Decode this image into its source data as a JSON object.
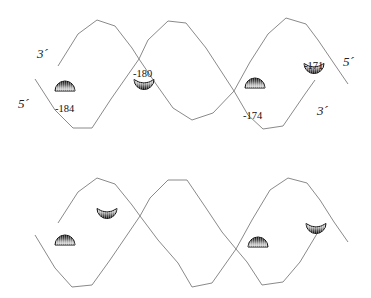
{
  "figure": {
    "panels": [
      {
        "id": "top",
        "strand_ends": [
          {
            "text": "3´",
            "x": 37,
            "y": 58
          },
          {
            "text": "5´",
            "x": 18,
            "y": 108
          },
          {
            "text": "5´",
            "x": 343,
            "y": 66
          },
          {
            "text": "3´",
            "x": 317,
            "y": 115
          }
        ],
        "strand_a": "58,66 78,34 97,20 115,26 132,48 139,59 156,84 173,108 192,120 213,113 234,91 250,62 268,34 286,18 306,24 318,40 335,65 348,84",
        "strand_b": "35,79 55,110 73,128 92,128 111,99 139,59 148,40 168,21 186,23 206,48 234,91 248,115 263,129 283,126 305,94 315,80",
        "sites": [
          {
            "label": "-184",
            "label_x": 55,
            "label_y": 112,
            "shape": "cap-up",
            "cx": 65,
            "cy": 91
          },
          {
            "label": "-180",
            "label_x": 133,
            "label_y": 77,
            "shape": "cup-down",
            "cx": 144,
            "cy": 85
          },
          {
            "label": "-174",
            "label_x": 243,
            "label_y": 119,
            "shape": "cap-up",
            "cx": 255,
            "cy": 88
          },
          {
            "label": "-171",
            "label_x": 304,
            "label_y": 69,
            "shape": "cup-down",
            "cx": 314,
            "cy": 69
          }
        ]
      },
      {
        "id": "bottom",
        "strand_ends": [],
        "strand_a": "58,223 78,192 97,178 115,184 132,205 140,216 158,240 178,263 192,287 212,283 224,266 236,249 252,220 270,190 288,178 307,183 320,200 334,222 348,242",
        "strand_b": "35,235 55,268 72,287 92,285 110,260 140,216 150,198 168,180 187,180 206,208 222,232 236,249 247,262 262,285 283,282 300,262 318,232",
        "sites": [
          {
            "label": "",
            "shape": "cap-up",
            "cx": 65,
            "cy": 245
          },
          {
            "label": "",
            "shape": "cup-down",
            "cx": 107,
            "cy": 214
          },
          {
            "label": "",
            "shape": "cap-up",
            "cx": 258,
            "cy": 247
          },
          {
            "label": "",
            "shape": "cup-down",
            "cx": 316,
            "cy": 229
          }
        ]
      }
    ]
  }
}
